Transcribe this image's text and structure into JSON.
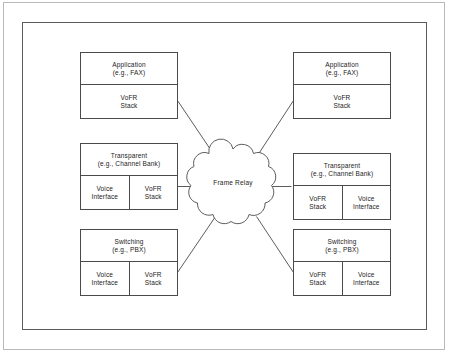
{
  "diagram": {
    "network_cloud": {
      "label": "Frame Relay",
      "icon": "cloud-icon"
    },
    "colors": {
      "stroke": "#4a4a4a",
      "frame": "#5a5a5a",
      "page_edge": "#b9b9b9",
      "text": "#1b1b1b",
      "background": "#ffffff"
    },
    "nodes": [
      {
        "id": "left-application",
        "side": "left",
        "title_line1": "Application",
        "title_line2": "(e.g., FAX)",
        "cells": [
          {
            "line1": "VoFR",
            "line2": "Stack"
          }
        ]
      },
      {
        "id": "left-transparent",
        "side": "left",
        "title_line1": "Transparent",
        "title_line2": "(e.g., Channel Bank)",
        "cells": [
          {
            "line1": "Voice",
            "line2": "Interface"
          },
          {
            "line1": "VoFR",
            "line2": "Stack"
          }
        ]
      },
      {
        "id": "left-switching",
        "side": "left",
        "title_line1": "Switching",
        "title_line2": "(e.g., PBX)",
        "cells": [
          {
            "line1": "Voice",
            "line2": "Interface"
          },
          {
            "line1": "VoFR",
            "line2": "Stack"
          }
        ]
      },
      {
        "id": "right-application",
        "side": "right",
        "title_line1": "Application",
        "title_line2": "(e.g., FAX)",
        "cells": [
          {
            "line1": "VoFR",
            "line2": "Stack"
          }
        ]
      },
      {
        "id": "right-transparent",
        "side": "right",
        "title_line1": "Transparent",
        "title_line2": "(e.g., Channel Bank)",
        "cells": [
          {
            "line1": "VoFR",
            "line2": "Stack"
          },
          {
            "line1": "Voice",
            "line2": "Interface"
          }
        ]
      },
      {
        "id": "right-switching",
        "side": "right",
        "title_line1": "Switching",
        "title_line2": "(e.g., PBX)",
        "cells": [
          {
            "line1": "VoFR",
            "line2": "Stack"
          },
          {
            "line1": "Voice",
            "line2": "Interface"
          }
        ]
      }
    ],
    "connections": [
      {
        "from": "left-application",
        "to": "network_cloud",
        "style": "diagonal"
      },
      {
        "from": "left-transparent",
        "to": "network_cloud",
        "style": "horizontal"
      },
      {
        "from": "left-switching",
        "to": "network_cloud",
        "style": "diagonal"
      },
      {
        "from": "network_cloud",
        "to": "right-application",
        "style": "diagonal"
      },
      {
        "from": "network_cloud",
        "to": "right-transparent",
        "style": "horizontal"
      },
      {
        "from": "network_cloud",
        "to": "right-switching",
        "style": "diagonal"
      }
    ]
  }
}
